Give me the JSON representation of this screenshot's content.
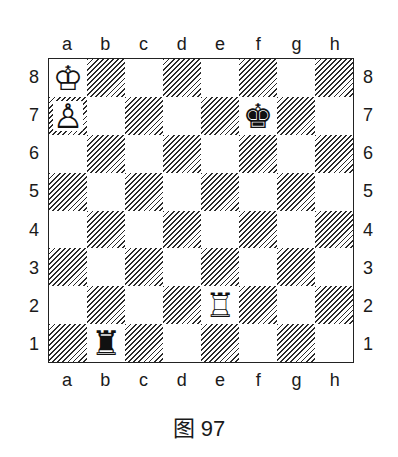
{
  "diagram": {
    "caption": "图 97",
    "files": [
      "a",
      "b",
      "c",
      "d",
      "e",
      "f",
      "g",
      "h"
    ],
    "ranks": [
      "8",
      "7",
      "6",
      "5",
      "4",
      "3",
      "2",
      "1"
    ],
    "square_style": {
      "light": "#ffffff",
      "dark": "diagonal-hatch"
    },
    "pieces": [
      {
        "square": "a8",
        "color": "white",
        "type": "king",
        "glyph": "♔"
      },
      {
        "square": "a7",
        "color": "white",
        "type": "pawn",
        "glyph": "♙"
      },
      {
        "square": "f7",
        "color": "black",
        "type": "king",
        "glyph": "♚"
      },
      {
        "square": "e2",
        "color": "white",
        "type": "rook",
        "glyph": "♖"
      },
      {
        "square": "b1",
        "color": "black",
        "type": "rook",
        "glyph": "♜"
      }
    ]
  }
}
